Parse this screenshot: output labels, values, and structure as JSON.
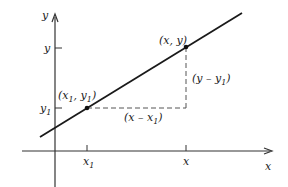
{
  "diagram": {
    "title": "",
    "axes": {
      "x_label": "x",
      "y_label": "y"
    },
    "ticks": {
      "x1": "x",
      "x1_sub": "1",
      "x": "x",
      "y": "y",
      "y1": "y",
      "y1_sub": "1"
    },
    "points": {
      "p1_open": "(x",
      "p1_sub1": "1",
      "p1_mid": ", y",
      "p1_sub2": "1",
      "p1_close": ")",
      "p2": "(x, y)"
    },
    "differences": {
      "dx_open": "(x – x",
      "dx_sub": "1",
      "dx_close": ")",
      "dy_open": "(y – y",
      "dy_sub": "1",
      "dy_close": ")"
    },
    "colors": {
      "line": "#1a1a1a",
      "axis": "#333333",
      "dashed": "#555555",
      "background": "#ffffff"
    }
  }
}
